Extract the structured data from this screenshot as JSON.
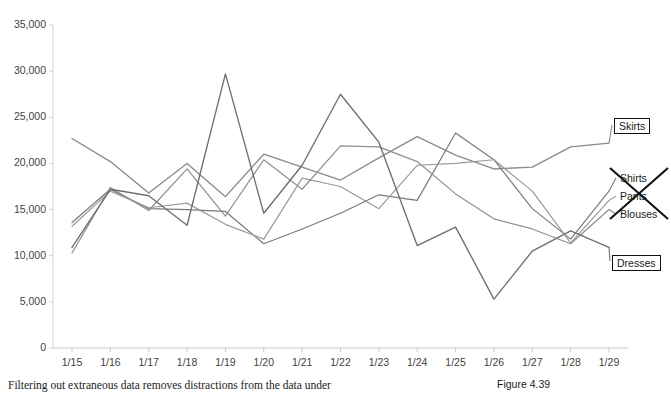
{
  "chart_data": {
    "type": "line",
    "title": "",
    "xlabel": "",
    "ylabel": "",
    "ylim": [
      0,
      35000
    ],
    "ytick_step": 5000,
    "yticks": [
      "0",
      "5,000",
      "10,000",
      "15,000",
      "20,000",
      "25,000",
      "30,000",
      "35,000"
    ],
    "grid": false,
    "legend_position": "right-inline-labels",
    "categories": [
      "1/15",
      "1/16",
      "1/17",
      "1/18",
      "1/19",
      "1/20",
      "1/21",
      "1/22",
      "1/23",
      "1/24",
      "1/25",
      "1/26",
      "1/27",
      "1/28",
      "1/29"
    ],
    "series": [
      {
        "name": "Skirts",
        "color": "#8a8a8a",
        "highlighted": true,
        "struck_out": false,
        "values": [
          22700,
          20200,
          16800,
          20000,
          16400,
          21000,
          19600,
          18200,
          20600,
          22900,
          20900,
          19400,
          19600,
          21800,
          22200
        ]
      },
      {
        "name": "Shirts",
        "color": "#7a7a7a",
        "highlighted": false,
        "struck_out": true,
        "values": [
          13600,
          17200,
          15100,
          15000,
          14800,
          11300,
          12900,
          14600,
          16600,
          16000,
          23300,
          20400,
          15100,
          11800,
          17000
        ]
      },
      {
        "name": "Pants",
        "color": "#9a9a9a",
        "highlighted": false,
        "struck_out": true,
        "values": [
          13200,
          17000,
          15200,
          15700,
          13400,
          11800,
          18400,
          17500,
          15100,
          19800,
          20000,
          20400,
          17000,
          11400,
          16000
        ]
      },
      {
        "name": "Blouses",
        "color": "#8f8f8f",
        "highlighted": false,
        "struck_out": true,
        "values": [
          10300,
          17400,
          14900,
          19400,
          14300,
          20400,
          17200,
          21900,
          21800,
          20200,
          16700,
          14000,
          12900,
          11300,
          15000
        ]
      },
      {
        "name": "Dresses",
        "color": "#6e6e6e",
        "highlighted": true,
        "struck_out": false,
        "values": [
          10900,
          17200,
          16500,
          13300,
          29700,
          14600,
          19800,
          27500,
          22300,
          11100,
          13100,
          5300,
          10500,
          12700,
          10900
        ]
      }
    ]
  },
  "labels": {
    "skirts": "Skirts",
    "shirts": "Shirts",
    "pants": "Pants",
    "blouses": "Blouses",
    "dresses": "Dresses"
  },
  "caption": {
    "body": "Filtering out extraneous data removes distractions from the data under",
    "figure": "Figure 4.39"
  }
}
